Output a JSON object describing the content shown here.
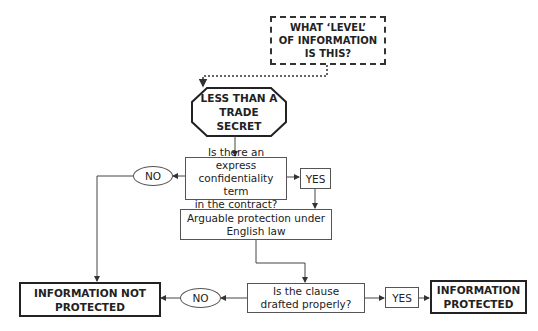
{
  "diagram": {
    "start": {
      "text_lines": [
        "WHAT ‘LEVEL’",
        "OF INFORMATION",
        "IS THIS?"
      ]
    },
    "category": {
      "text_lines": [
        "LESS THAN A",
        "TRADE",
        "SECRET"
      ]
    },
    "question1": {
      "text_lines": [
        "Is there an express",
        "confidentiality term",
        "in the contract?"
      ]
    },
    "q1_no": {
      "label": "NO"
    },
    "q1_yes": {
      "label": "YES"
    },
    "outcome_arguable": {
      "text_lines": [
        "Arguable protection under",
        "English law"
      ]
    },
    "question2": {
      "text_lines": [
        "Is the clause",
        "drafted properly?"
      ]
    },
    "q2_no": {
      "label": "NO"
    },
    "q2_yes": {
      "label": "YES"
    },
    "result_not_protected": {
      "text_lines": [
        "INFORMATION NOT",
        "PROTECTED"
      ]
    },
    "result_protected": {
      "text_lines": [
        "INFORMATION",
        "PROTECTED"
      ]
    },
    "colors": {
      "line": "#444444",
      "text": "#222222",
      "background": "#ffffff"
    }
  }
}
